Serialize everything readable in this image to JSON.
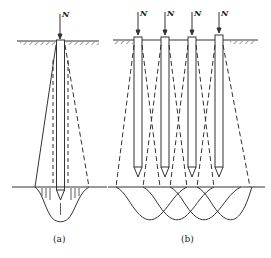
{
  "figure_a": {
    "caption": "(a)",
    "load_label": "N",
    "description": "Single pile with stress spreading zone (solid and dashed lines) and stress bulb below pile tip"
  },
  "figure_b": {
    "caption": "(b)",
    "load_labels": [
      "N",
      "N",
      "N",
      "N"
    ],
    "description": "Pile group of four piles with overlapping stress zones and overlapping stress bulbs below tips"
  },
  "colors": {
    "line": "#333333",
    "background": "#ffffff"
  }
}
